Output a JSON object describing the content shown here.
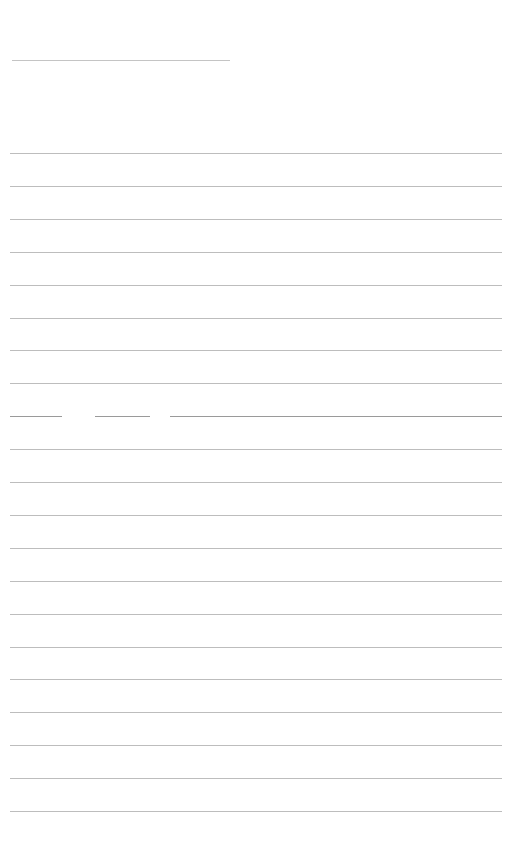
{
  "document": {
    "type": "lined-paper",
    "background": "#ffffff",
    "line_color": "#bdbdbd",
    "title_line": {
      "x": 12,
      "y": 60,
      "width": 218
    },
    "ruled_lines": {
      "x": 10,
      "width": 492,
      "first_y": 153,
      "spacing": 32.9,
      "count": 21
    },
    "broken_line_index": 8,
    "broken_line_segments": [
      {
        "x": 10,
        "width": 52
      },
      {
        "x": 95,
        "width": 55
      },
      {
        "x": 170,
        "width": 332
      }
    ]
  }
}
